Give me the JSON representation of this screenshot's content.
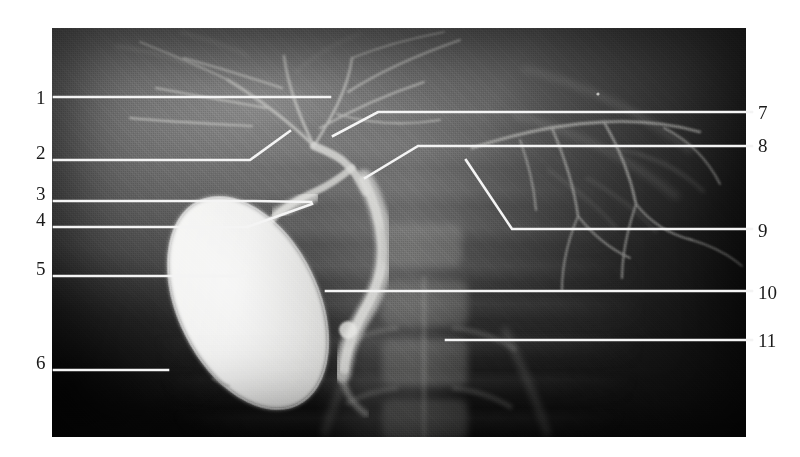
{
  "figure": {
    "type": "radiograph-cholangiogram",
    "modality": "X-ray cholangiogram",
    "image_area": {
      "x": 52,
      "y": 28,
      "width": 694,
      "height": 409
    },
    "background_color": "#ffffff",
    "leader_line_color": "#f2f2f2",
    "label_color": "#1a1a1a"
  },
  "labels": {
    "left": [
      {
        "id": "1",
        "text": "1",
        "x": 36,
        "y": 88
      },
      {
        "id": "2",
        "text": "2",
        "x": 36,
        "y": 143
      },
      {
        "id": "3",
        "text": "3",
        "x": 36,
        "y": 184
      },
      {
        "id": "4",
        "text": "4",
        "x": 36,
        "y": 210
      },
      {
        "id": "5",
        "text": "5",
        "x": 36,
        "y": 259
      },
      {
        "id": "6",
        "text": "6",
        "x": 36,
        "y": 353
      }
    ],
    "right": [
      {
        "id": "7",
        "text": "7",
        "x": 758,
        "y": 103
      },
      {
        "id": "8",
        "text": "8",
        "x": 758,
        "y": 136
      },
      {
        "id": "9",
        "text": "9",
        "x": 758,
        "y": 221
      },
      {
        "id": "10",
        "text": "10",
        "x": 758,
        "y": 283
      },
      {
        "id": "11",
        "text": "11",
        "x": 758,
        "y": 331
      }
    ]
  },
  "leader_lines": [
    {
      "id": "leader-1",
      "points": "54,97 330,97"
    },
    {
      "id": "leader-2",
      "points": "54,160 250,160 290,131"
    },
    {
      "id": "leader-3",
      "points": "54,201 253,201 311,202"
    },
    {
      "id": "leader-4",
      "points": "54,227 247,227 312,204"
    },
    {
      "id": "leader-5",
      "points": "54,276 245,276"
    },
    {
      "id": "leader-6",
      "points": "54,370 168,370"
    },
    {
      "id": "leader-7",
      "points": "333,136 378,112 752,112"
    },
    {
      "id": "leader-8",
      "points": "365,178 418,146 752,146"
    },
    {
      "id": "leader-9",
      "points": "466,160 512,229 752,229"
    },
    {
      "id": "leader-10",
      "points": "326,291 752,291"
    },
    {
      "id": "leader-11",
      "points": "446,340 752,340"
    }
  ]
}
